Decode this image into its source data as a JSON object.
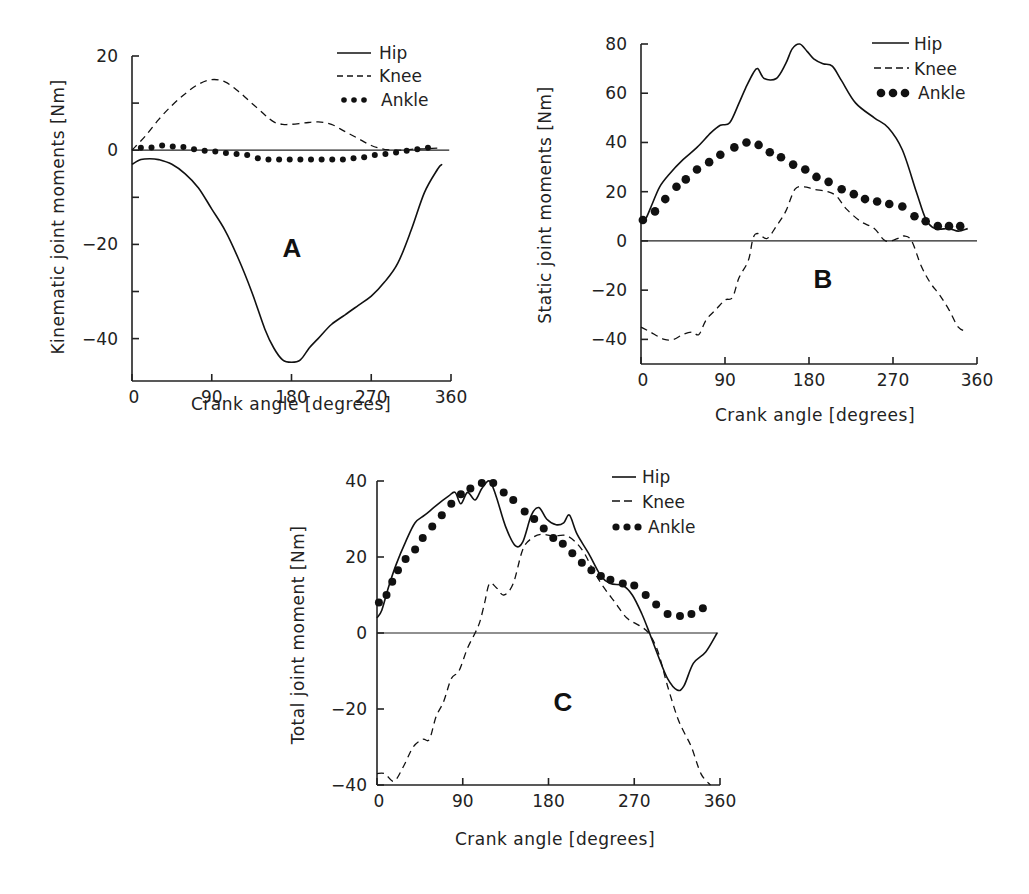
{
  "chart_data": [
    {
      "id": "A",
      "type": "line",
      "panel_label": "A",
      "title": "",
      "xlabel": "Crank angle [degrees]",
      "ylabel": "Kinematic joint moments [Nm]",
      "xlim": [
        0,
        360
      ],
      "ylim": [
        -49,
        20
      ],
      "xticks": [
        0,
        90,
        180,
        270,
        360
      ],
      "yticks": [
        20,
        0,
        -20,
        -40
      ],
      "yticks_minor": [
        10,
        -10,
        -30
      ],
      "grid": false,
      "zero_line": true,
      "legend": {
        "placement": "top-right",
        "entries": [
          "Hip",
          "Knee",
          "Ankle"
        ]
      },
      "series": [
        {
          "name": "Hip",
          "style": "solid",
          "x": [
            0,
            10,
            20,
            30,
            45,
            60,
            75,
            90,
            105,
            120,
            135,
            150,
            160,
            170,
            180,
            190,
            200,
            210,
            225,
            240,
            255,
            270,
            285,
            300,
            315,
            330,
            345,
            350
          ],
          "y": [
            -3,
            -2,
            -1.8,
            -2,
            -3,
            -5,
            -8,
            -12.5,
            -17,
            -23,
            -30,
            -38,
            -42,
            -44.5,
            -45,
            -44.5,
            -42,
            -40,
            -37,
            -35,
            -33,
            -31,
            -28,
            -24,
            -17,
            -9,
            -4,
            -3
          ]
        },
        {
          "name": "Knee",
          "style": "dashed",
          "x": [
            0,
            15,
            30,
            45,
            60,
            75,
            90,
            105,
            120,
            135,
            150,
            160,
            170,
            180,
            195,
            210,
            225,
            240,
            255,
            270,
            285,
            300,
            315,
            330,
            350
          ],
          "y": [
            0,
            3,
            6.5,
            9.5,
            12,
            14,
            15,
            14.5,
            12.5,
            10,
            7.5,
            6,
            5.5,
            5.5,
            5.8,
            6,
            5.5,
            4,
            2.5,
            1,
            0.2,
            0,
            0.2,
            0.3,
            0.5
          ]
        },
        {
          "name": "Ankle",
          "style": "dotted",
          "x": [
            10,
            22,
            34,
            46,
            58,
            70,
            82,
            94,
            106,
            118,
            130,
            142,
            154,
            166,
            178,
            190,
            202,
            214,
            226,
            238,
            250,
            262,
            274,
            286,
            298,
            310,
            322,
            334
          ],
          "y": [
            0.5,
            0.6,
            1,
            0.8,
            0.7,
            0.2,
            -0.1,
            -0.3,
            -0.6,
            -0.8,
            -1,
            -1.7,
            -2,
            -2,
            -2,
            -2,
            -2,
            -2,
            -2,
            -2,
            -1.7,
            -1.5,
            -1,
            -0.8,
            -0.5,
            -0.1,
            0.2,
            0.5
          ]
        }
      ]
    },
    {
      "id": "B",
      "type": "line",
      "panel_label": "B",
      "title": "",
      "xlabel": "Crank angle [degrees]",
      "ylabel": "Static joint moments [Nm]",
      "xlim": [
        0,
        360
      ],
      "ylim": [
        -50,
        80
      ],
      "xticks": [
        0,
        90,
        180,
        270,
        360
      ],
      "yticks": [
        80,
        60,
        40,
        20,
        0,
        -20,
        -40
      ],
      "grid": false,
      "zero_line": true,
      "legend": {
        "placement": "top-right",
        "entries": [
          "Hip",
          "Knee",
          "Ankle"
        ]
      },
      "series": [
        {
          "name": "Hip",
          "style": "solid",
          "x": [
            0,
            5,
            12,
            20,
            30,
            45,
            60,
            75,
            85,
            95,
            105,
            112,
            120,
            125,
            132,
            145,
            155,
            162,
            170,
            178,
            185,
            195,
            205,
            215,
            230,
            250,
            265,
            280,
            295,
            305,
            315,
            330,
            340,
            350
          ],
          "y": [
            8,
            9,
            15,
            22,
            27,
            33,
            38,
            44,
            47,
            48,
            56,
            62,
            68,
            70,
            66,
            66,
            72,
            78,
            80,
            77,
            74,
            72,
            71,
            65,
            56,
            50,
            46,
            37,
            20,
            9,
            5,
            5,
            4,
            5
          ]
        },
        {
          "name": "Knee",
          "style": "dashed",
          "x": [
            0,
            10,
            25,
            35,
            45,
            55,
            62,
            70,
            80,
            90,
            98,
            105,
            115,
            120,
            125,
            135,
            145,
            155,
            165,
            175,
            185,
            200,
            210,
            220,
            235,
            250,
            262,
            275,
            282,
            290,
            300,
            310,
            320,
            330,
            340,
            350
          ],
          "y": [
            -35,
            -37,
            -40,
            -40,
            -38,
            -37,
            -38,
            -32,
            -28,
            -24,
            -23,
            -15,
            -8,
            1,
            3,
            1,
            6,
            12,
            21,
            22,
            21,
            20,
            18,
            13,
            8,
            5,
            0,
            1,
            2,
            0,
            -10,
            -17,
            -22,
            -28,
            -35,
            -37
          ]
        },
        {
          "name": "Ankle",
          "style": "dotted",
          "x": [
            2,
            15,
            26,
            38,
            48,
            60,
            73,
            85,
            100,
            113,
            126,
            138,
            150,
            163,
            176,
            188,
            201,
            215,
            228,
            240,
            253,
            266,
            280,
            293,
            305,
            318,
            330,
            342
          ],
          "y": [
            8.5,
            12,
            17,
            22,
            25,
            29,
            32,
            35,
            38,
            40,
            39,
            36,
            34,
            31,
            29,
            26,
            24,
            21,
            19,
            17,
            16,
            15,
            14,
            10,
            8,
            6,
            6,
            6
          ]
        }
      ]
    },
    {
      "id": "C",
      "type": "line",
      "panel_label": "C",
      "title": "",
      "xlabel": "Crank angle [degrees]",
      "ylabel": "Total joint moment [Nm]",
      "xlim": [
        0,
        360
      ],
      "ylim": [
        -40,
        40
      ],
      "xticks": [
        0,
        90,
        180,
        270,
        360
      ],
      "yticks": [
        40,
        20,
        0,
        -20,
        -40
      ],
      "grid": false,
      "zero_line": true,
      "legend": {
        "placement": "top-right",
        "entries": [
          "Hip",
          "Knee",
          "Ankle"
        ]
      },
      "series": [
        {
          "name": "Hip",
          "style": "solid",
          "x": [
            0,
            5,
            12,
            20,
            30,
            40,
            50,
            62,
            75,
            82,
            88,
            95,
            103,
            110,
            118,
            125,
            135,
            145,
            153,
            162,
            170,
            178,
            188,
            196,
            202,
            210,
            222,
            235,
            245,
            258,
            268,
            278,
            286,
            295,
            305,
            315,
            322,
            332,
            345,
            357
          ],
          "y": [
            4,
            6,
            12,
            18,
            24,
            29,
            31,
            33.5,
            36,
            37,
            34,
            37,
            35,
            38,
            40,
            36,
            28,
            23,
            24,
            31,
            33,
            30,
            28.5,
            29,
            31,
            26,
            21,
            15,
            13,
            12.5,
            10,
            5,
            0,
            -6,
            -12,
            -15,
            -14,
            -8,
            -5,
            0
          ]
        },
        {
          "name": "Knee",
          "style": "dashed",
          "x": [
            0,
            8,
            18,
            28,
            38,
            48,
            55,
            62,
            70,
            78,
            86,
            95,
            103,
            108,
            113,
            118,
            125,
            133,
            143,
            153,
            163,
            173,
            185,
            200,
            215,
            228,
            238,
            250,
            262,
            275,
            285,
            295,
            305,
            315,
            322,
            330,
            340,
            350
          ],
          "y": [
            -37,
            -37,
            -39,
            -35,
            -30,
            -28,
            -28,
            -22,
            -18,
            -12,
            -10,
            -4,
            0,
            3,
            8,
            13,
            12,
            10,
            13,
            22,
            25,
            26,
            25.5,
            25.5,
            22,
            16,
            12,
            8,
            4,
            2,
            0,
            -5,
            -14,
            -22,
            -26,
            -30,
            -37,
            -40
          ]
        },
        {
          "name": "Ankle",
          "style": "dotted",
          "x": [
            2,
            10,
            16,
            22,
            30,
            40,
            48,
            58,
            68,
            78,
            88,
            98,
            110,
            122,
            133,
            143,
            155,
            165,
            175,
            185,
            195,
            205,
            215,
            225,
            235,
            245,
            258,
            270,
            282,
            293,
            305,
            318,
            330,
            342
          ],
          "y": [
            8,
            10,
            13.5,
            16.5,
            19.5,
            22,
            25,
            28,
            31,
            34,
            36.5,
            38,
            39.5,
            39.5,
            37,
            35,
            32,
            30,
            27.5,
            25,
            23.5,
            21,
            18.5,
            16.5,
            15,
            14,
            13,
            12.5,
            10,
            7.5,
            5,
            4.5,
            5,
            6.5
          ]
        }
      ]
    }
  ]
}
